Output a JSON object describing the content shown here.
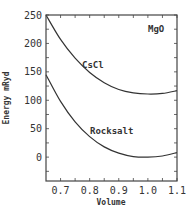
{
  "chart_data": {
    "type": "line",
    "title": "",
    "annotation": "MgO",
    "xlabel": "Volume",
    "ylabel": "Energy mRyd",
    "xlim": [
      0.65,
      1.1
    ],
    "ylim": [
      -42,
      250
    ],
    "grid": false,
    "legend": "none (inline curve labels)",
    "x_ticks": [
      "0.7",
      "0.8",
      "0.9",
      "1.0",
      "1.1"
    ],
    "y_ticks": [
      "0",
      "50",
      "100",
      "150",
      "200",
      "250"
    ],
    "series": [
      {
        "name": "CsCl",
        "x": [
          0.65,
          0.7,
          0.75,
          0.8,
          0.85,
          0.9,
          0.95,
          1.0,
          1.05,
          1.1
        ],
        "y": [
          250,
          207,
          174,
          149,
          131,
          119,
          113,
          111,
          112,
          117
        ]
      },
      {
        "name": "Rocksalt",
        "x": [
          0.65,
          0.7,
          0.75,
          0.8,
          0.85,
          0.9,
          0.95,
          1.0,
          1.05,
          1.1
        ],
        "y": [
          145,
          98,
          62,
          36,
          18,
          7,
          1,
          0,
          2,
          8
        ]
      }
    ]
  },
  "labels": {
    "annotation": "MgO",
    "xlabel": "Volume",
    "ylabel": "Energy mRyd",
    "series0": "CsCl",
    "series1": "Rocksalt"
  }
}
